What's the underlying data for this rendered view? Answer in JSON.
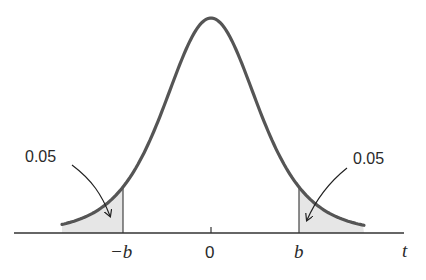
{
  "diagram": {
    "type": "t-distribution two-tailed critical region",
    "axis_label": "t",
    "ticks": [
      {
        "label": "−b",
        "x": 123
      },
      {
        "label": "0",
        "x": 211
      },
      {
        "label": "b",
        "x": 299
      }
    ],
    "left_tail": {
      "area_label": "0.05"
    },
    "right_tail": {
      "area_label": "0.05"
    },
    "colors": {
      "curve": "#555555",
      "shade": "#e6e6e6",
      "axis": "#333333",
      "text": "#2a2a2a"
    }
  }
}
